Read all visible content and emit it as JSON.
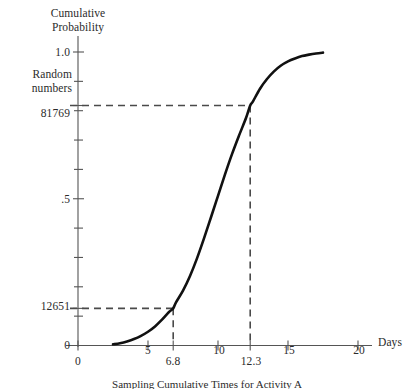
{
  "chart_data": {
    "type": "line",
    "title": "",
    "subtitle": "",
    "xlabel": "Days",
    "ylabel": "Cumulative Probability",
    "y_secondary_label": "Random numbers",
    "xlim": [
      0,
      21.2
    ],
    "ylim": [
      0,
      1.06
    ],
    "grid": false,
    "legend": null,
    "x_ticks": [
      {
        "value": 0,
        "label": "0"
      },
      {
        "value": 5,
        "label": "5"
      },
      {
        "value": 10,
        "label": "10"
      },
      {
        "value": 15,
        "label": "15"
      },
      {
        "value": 20,
        "label": "20"
      }
    ],
    "x_callout_ticks": [
      {
        "value": 6.8,
        "label": "6.8"
      },
      {
        "value": 12.3,
        "label": "12.3"
      }
    ],
    "y_ticks": [
      {
        "value": 1.0,
        "label": "1.0"
      },
      {
        "value": 0.9,
        "label": ""
      },
      {
        "value": 0.8,
        "label": ""
      },
      {
        "value": 0.7,
        "label": ""
      },
      {
        "value": 0.6,
        "label": ""
      },
      {
        "value": 0.5,
        "label": ".5"
      },
      {
        "value": 0.4,
        "label": ""
      },
      {
        "value": 0.3,
        "label": ""
      },
      {
        "value": 0.2,
        "label": ""
      },
      {
        "value": 0.1,
        "label": ""
      },
      {
        "value": 0.0,
        "label": "0"
      }
    ],
    "y_callout_ticks": [
      {
        "value": 0.81769,
        "label": "81769"
      },
      {
        "value": 0.12651,
        "label": "12651"
      }
    ],
    "series": [
      {
        "name": "Cumulative probability ogive",
        "color": "#111111",
        "points": [
          {
            "x": 2.5,
            "y": 0.004
          },
          {
            "x": 3.0,
            "y": 0.008
          },
          {
            "x": 3.5,
            "y": 0.014
          },
          {
            "x": 4.0,
            "y": 0.022
          },
          {
            "x": 4.5,
            "y": 0.033
          },
          {
            "x": 5.0,
            "y": 0.047
          },
          {
            "x": 5.5,
            "y": 0.065
          },
          {
            "x": 6.0,
            "y": 0.088
          },
          {
            "x": 6.5,
            "y": 0.114
          },
          {
            "x": 6.8,
            "y": 0.12651
          },
          {
            "x": 7.0,
            "y": 0.147
          },
          {
            "x": 7.5,
            "y": 0.187
          },
          {
            "x": 8.0,
            "y": 0.237
          },
          {
            "x": 8.5,
            "y": 0.297
          },
          {
            "x": 9.0,
            "y": 0.365
          },
          {
            "x": 9.5,
            "y": 0.437
          },
          {
            "x": 10.0,
            "y": 0.51
          },
          {
            "x": 10.5,
            "y": 0.583
          },
          {
            "x": 11.0,
            "y": 0.652
          },
          {
            "x": 11.5,
            "y": 0.715
          },
          {
            "x": 12.0,
            "y": 0.775
          },
          {
            "x": 12.3,
            "y": 0.81769
          },
          {
            "x": 12.5,
            "y": 0.832
          },
          {
            "x": 13.0,
            "y": 0.875
          },
          {
            "x": 13.5,
            "y": 0.908
          },
          {
            "x": 14.0,
            "y": 0.934
          },
          {
            "x": 14.5,
            "y": 0.954
          },
          {
            "x": 15.0,
            "y": 0.968
          },
          {
            "x": 15.5,
            "y": 0.978
          },
          {
            "x": 16.0,
            "y": 0.986
          },
          {
            "x": 16.5,
            "y": 0.991
          },
          {
            "x": 17.0,
            "y": 0.995
          },
          {
            "x": 17.5,
            "y": 0.998
          }
        ]
      }
    ],
    "annotations": [
      {
        "name": "upper-sample",
        "random_number": "81769",
        "probability": 0.81769,
        "days": 12.3,
        "days_label": "12.3",
        "style": "dashed",
        "color": "#4a4a4a"
      },
      {
        "name": "lower-sample",
        "random_number": "12651",
        "probability": 0.12651,
        "days": 6.8,
        "days_label": "6.8",
        "style": "dashed",
        "color": "#4a4a4a"
      }
    ]
  },
  "axes": {
    "y_title_line1": "Cumulative",
    "y_title_line2": "Probability",
    "random_caption_line1": "Random",
    "random_caption_line2": "numbers",
    "x_title": "Days"
  },
  "labels": {
    "y_one": "1.0",
    "y_half": ".5",
    "y_zero": "0",
    "rand_high": "81769",
    "rand_low": "12651",
    "x_zero": "0",
    "x_five": "5",
    "x_ten": "10",
    "x_fifteen": "15",
    "x_twenty": "20",
    "x_callout_low": "6.8",
    "x_callout_high": "12.3",
    "x_axis_title": "Days"
  },
  "caption": {
    "partial_text": "Sampling Cumulative Times for Activity A"
  },
  "colors": {
    "curve": "#111111",
    "axis": "#555555",
    "dashed": "#4a4a4a",
    "text": "#2b2b2b",
    "background": "#ffffff"
  }
}
